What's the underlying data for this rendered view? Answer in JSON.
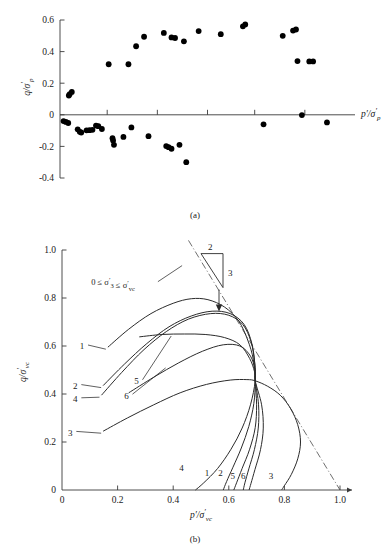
{
  "figure": {
    "panel_a_caption": "(a)",
    "panel_b_caption": "(b)"
  },
  "chart_data": [
    {
      "type": "scatter",
      "panel": "(a)",
      "title": "",
      "xlabel": "p'/σ'p",
      "ylabel": "q/σ'p",
      "xlim": [
        0,
        1.0
      ],
      "ylim": [
        -0.4,
        0.6
      ],
      "grid": false,
      "legend": "none",
      "ytick_labels": [
        "0.6",
        "0.4",
        "0.2",
        "0",
        "-0.2",
        "-0.4"
      ],
      "ytick_values": [
        0.6,
        0.4,
        0.2,
        0,
        -0.2,
        -0.4
      ],
      "xtick_labels": [
        "",
        "",
        "",
        "",
        ""
      ],
      "xtick_values": [
        0.16,
        0.33,
        0.5,
        0.66,
        0.83
      ],
      "axis_note": "x-axis drawn at y=0 with unlabeled tick marks",
      "points": [
        [
          0.012,
          -0.04
        ],
        [
          0.02,
          -0.045
        ],
        [
          0.028,
          -0.052
        ],
        [
          0.03,
          0.122
        ],
        [
          0.033,
          0.131
        ],
        [
          0.04,
          0.145
        ],
        [
          0.06,
          -0.092
        ],
        [
          0.067,
          -0.108
        ],
        [
          0.072,
          -0.112
        ],
        [
          0.09,
          -0.098
        ],
        [
          0.1,
          -0.097
        ],
        [
          0.11,
          -0.095
        ],
        [
          0.122,
          -0.068
        ],
        [
          0.13,
          -0.072
        ],
        [
          0.142,
          -0.09
        ],
        [
          0.165,
          0.32
        ],
        [
          0.178,
          -0.148
        ],
        [
          0.18,
          -0.163
        ],
        [
          0.183,
          -0.19
        ],
        [
          0.215,
          -0.14
        ],
        [
          0.232,
          0.32
        ],
        [
          0.242,
          -0.08
        ],
        [
          0.258,
          0.434
        ],
        [
          0.285,
          0.494
        ],
        [
          0.3,
          -0.135
        ],
        [
          0.352,
          0.518
        ],
        [
          0.36,
          -0.198
        ],
        [
          0.368,
          -0.205
        ],
        [
          0.378,
          -0.215
        ],
        [
          0.378,
          0.49
        ],
        [
          0.39,
          0.486
        ],
        [
          0.405,
          -0.19
        ],
        [
          0.42,
          0.465
        ],
        [
          0.428,
          -0.3
        ],
        [
          0.47,
          0.53
        ],
        [
          0.545,
          0.51
        ],
        [
          0.62,
          0.56
        ],
        [
          0.628,
          0.572
        ],
        [
          0.69,
          -0.06
        ],
        [
          0.755,
          0.5
        ],
        [
          0.79,
          0.533
        ],
        [
          0.8,
          0.54
        ],
        [
          0.805,
          0.34
        ],
        [
          0.82,
          -0.002
        ],
        [
          0.845,
          0.338
        ],
        [
          0.858,
          0.338
        ],
        [
          0.905,
          -0.048
        ]
      ]
    },
    {
      "type": "line",
      "panel": "(b)",
      "title": "",
      "xlabel": "p'/σ'vc",
      "ylabel": "q/σ'vc",
      "xlim": [
        0,
        1.0
      ],
      "ylim": [
        0,
        1.0
      ],
      "grid": false,
      "legend": "inline curve numbers",
      "xtick_labels": [
        "0",
        "0.2",
        "0.4",
        "0.6",
        "0.8",
        "1.0"
      ],
      "xtick_values": [
        0,
        0.2,
        0.4,
        0.6,
        0.8,
        1.0
      ],
      "ytick_labels": [
        "0",
        "0.2",
        "0.4",
        "0.6",
        "0.8",
        "1.0"
      ],
      "ytick_values": [
        0,
        0.2,
        0.4,
        0.6,
        0.8,
        1.0
      ],
      "annotation": "0 ≤ σ'3 ≤ σ'vc",
      "slope_triangle": {
        "rise_label": "2",
        "run_label": "3"
      },
      "failure_line": {
        "style": "dash-dot",
        "from": [
          0.455,
          1.04
        ],
        "to": [
          1.0,
          0.0
        ]
      },
      "convergence_point": [
        0.695,
        0.455
      ],
      "series": [
        {
          "name": "1",
          "start_label_pos": "left",
          "end_label": "1",
          "points": [
            [
              0.165,
              0.595
            ],
            [
              0.24,
              0.67
            ],
            [
              0.32,
              0.735
            ],
            [
              0.4,
              0.778
            ],
            [
              0.465,
              0.797
            ],
            [
              0.525,
              0.793
            ],
            [
              0.585,
              0.762
            ],
            [
              0.635,
              0.705
            ],
            [
              0.668,
              0.625
            ],
            [
              0.688,
              0.545
            ],
            [
              0.695,
              0.455
            ],
            [
              0.69,
              0.36
            ],
            [
              0.672,
              0.265
            ],
            [
              0.645,
              0.175
            ],
            [
              0.615,
              0.095
            ],
            [
              0.592,
              0.035
            ],
            [
              0.58,
              0.0
            ]
          ]
        },
        {
          "name": "2",
          "start_label_pos": "left",
          "end_label": "2",
          "points": [
            [
              0.148,
              0.435
            ],
            [
              0.225,
              0.525
            ],
            [
              0.305,
              0.61
            ],
            [
              0.385,
              0.68
            ],
            [
              0.465,
              0.725
            ],
            [
              0.54,
              0.745
            ],
            [
              0.605,
              0.735
            ],
            [
              0.655,
              0.69
            ],
            [
              0.683,
              0.61
            ],
            [
              0.694,
              0.52
            ],
            [
              0.695,
              0.455
            ],
            [
              0.7,
              0.355
            ],
            [
              0.695,
              0.26
            ],
            [
              0.675,
              0.17
            ],
            [
              0.648,
              0.09
            ],
            [
              0.628,
              0.03
            ],
            [
              0.618,
              0.0
            ]
          ]
        },
        {
          "name": "3",
          "start_label_pos": "left",
          "end_label": "3",
          "points": [
            [
              0.148,
              0.245
            ],
            [
              0.235,
              0.3
            ],
            [
              0.33,
              0.355
            ],
            [
              0.425,
              0.405
            ],
            [
              0.52,
              0.44
            ],
            [
              0.605,
              0.458
            ],
            [
              0.665,
              0.46
            ],
            [
              0.695,
              0.455
            ],
            [
              0.74,
              0.432
            ],
            [
              0.785,
              0.395
            ],
            [
              0.822,
              0.34
            ],
            [
              0.848,
              0.272
            ],
            [
              0.858,
              0.2
            ],
            [
              0.848,
              0.13
            ],
            [
              0.825,
              0.065
            ],
            [
              0.8,
              0.018
            ],
            [
              0.79,
              0.0
            ]
          ]
        },
        {
          "name": "4",
          "start_label_pos": "left",
          "end_label": "4",
          "points": [
            [
              0.142,
              0.395
            ],
            [
              0.215,
              0.49
            ],
            [
              0.295,
              0.585
            ],
            [
              0.375,
              0.66
            ],
            [
              0.455,
              0.712
            ],
            [
              0.535,
              0.735
            ],
            [
              0.6,
              0.728
            ],
            [
              0.65,
              0.69
            ],
            [
              0.68,
              0.618
            ],
            [
              0.693,
              0.53
            ],
            [
              0.695,
              0.455
            ],
            [
              0.678,
              0.355
            ],
            [
              0.648,
              0.258
            ],
            [
              0.608,
              0.17
            ],
            [
              0.56,
              0.09
            ],
            [
              0.51,
              0.03
            ],
            [
              0.48,
              0.0
            ]
          ]
        },
        {
          "name": "5",
          "start_label_pos": "left",
          "end_label": "5",
          "points": [
            [
              0.278,
              0.638
            ],
            [
              0.36,
              0.648
            ],
            [
              0.44,
              0.65
            ],
            [
              0.515,
              0.648
            ],
            [
              0.585,
              0.635
            ],
            [
              0.64,
              0.605
            ],
            [
              0.675,
              0.548
            ],
            [
              0.692,
              0.495
            ],
            [
              0.695,
              0.455
            ],
            [
              0.707,
              0.355
            ],
            [
              0.706,
              0.258
            ],
            [
              0.692,
              0.168
            ],
            [
              0.672,
              0.088
            ],
            [
              0.658,
              0.03
            ],
            [
              0.652,
              0.0
            ]
          ]
        },
        {
          "name": "6",
          "start_label_pos": "left",
          "end_label": "6",
          "points": [
            [
              0.24,
              0.405
            ],
            [
              0.33,
              0.47
            ],
            [
              0.42,
              0.53
            ],
            [
              0.505,
              0.578
            ],
            [
              0.58,
              0.605
            ],
            [
              0.64,
              0.6
            ],
            [
              0.678,
              0.558
            ],
            [
              0.693,
              0.505
            ],
            [
              0.695,
              0.455
            ],
            [
              0.718,
              0.355
            ],
            [
              0.724,
              0.258
            ],
            [
              0.714,
              0.168
            ],
            [
              0.694,
              0.085
            ],
            [
              0.68,
              0.028
            ],
            [
              0.673,
              0.0
            ]
          ]
        }
      ],
      "left_labels": [
        {
          "text": "1",
          "x": 0.072,
          "y": 0.6
        },
        {
          "text": "2",
          "x": 0.048,
          "y": 0.435
        },
        {
          "text": "4",
          "x": 0.048,
          "y": 0.38
        },
        {
          "text": "5",
          "x": 0.268,
          "y": 0.455
        },
        {
          "text": "6",
          "x": 0.232,
          "y": 0.395
        },
        {
          "text": "3",
          "x": 0.03,
          "y": 0.24
        }
      ],
      "bottom_labels": [
        {
          "text": "4",
          "x": 0.43,
          "y": 0.095
        },
        {
          "text": "1",
          "x": 0.522,
          "y": 0.072
        },
        {
          "text": "2",
          "x": 0.57,
          "y": 0.072
        },
        {
          "text": "5",
          "x": 0.614,
          "y": 0.058
        },
        {
          "text": "6",
          "x": 0.652,
          "y": 0.058
        },
        {
          "text": "3",
          "x": 0.752,
          "y": 0.058
        }
      ]
    }
  ]
}
